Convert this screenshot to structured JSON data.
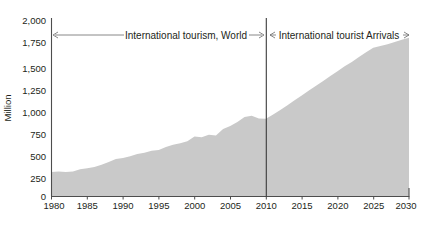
{
  "chart_data": {
    "type": "area",
    "title": "",
    "xlabel": "",
    "ylabel": "Million",
    "xlim": [
      1980,
      2030
    ],
    "ylim": [
      0,
      2000
    ],
    "grid": false,
    "legend": "none",
    "xticks": [
      "1980",
      "1985",
      "1990",
      "1995",
      "2000",
      "2005",
      "2010",
      "2015",
      "2020",
      "2025",
      "2030"
    ],
    "yticks": [
      "0",
      "250",
      "500",
      "750",
      "1,000",
      "1,250",
      "1,500",
      "1,750",
      "2,000"
    ],
    "series": [
      {
        "name": "International tourism, World",
        "x": [
          1980,
          1981,
          1982,
          1983,
          1984,
          1985,
          1986,
          1987,
          1988,
          1989,
          1990,
          1991,
          1992,
          1993,
          1994,
          1995,
          1996,
          1997,
          1998,
          1999,
          2000,
          2001,
          2002,
          2003,
          2004,
          2005,
          2006,
          2007,
          2008,
          2009,
          2010,
          2011,
          2012,
          2013,
          2014,
          2015,
          2016,
          2017,
          2018,
          2019,
          2020,
          2021,
          2022,
          2023,
          2024,
          2025,
          2026,
          2027,
          2028,
          2029,
          2030
        ],
        "values": [
          278,
          282,
          277,
          284,
          310,
          320,
          334,
          360,
          390,
          426,
          435,
          456,
          482,
          495,
          518,
          528,
          562,
          586,
          602,
          625,
          680,
          672,
          700,
          690,
          765,
          800,
          845,
          900,
          915,
          885,
          880,
          930,
          980,
          1035,
          1090,
          1145,
          1200,
          1255,
          1310,
          1365,
          1420,
          1475,
          1525,
          1580,
          1635,
          1685,
          1705,
          1725,
          1750,
          1775,
          1800
        ]
      }
    ],
    "annotations": [
      {
        "name": "left-span",
        "label": "International tourism, World",
        "x_start": 1980,
        "x_end": 2010,
        "arrows": "both"
      },
      {
        "name": "right-span",
        "label": "International tourist Arrivals",
        "x_start": 2010,
        "x_end": 2030,
        "arrows": "both"
      }
    ],
    "divider_x": 2010,
    "colors": {
      "area": "#c9c9c9",
      "axis": "#4d4d4d",
      "text": "#231f20",
      "divider": "#3a3a3a",
      "annotation_line": "#6a6a6a"
    }
  }
}
